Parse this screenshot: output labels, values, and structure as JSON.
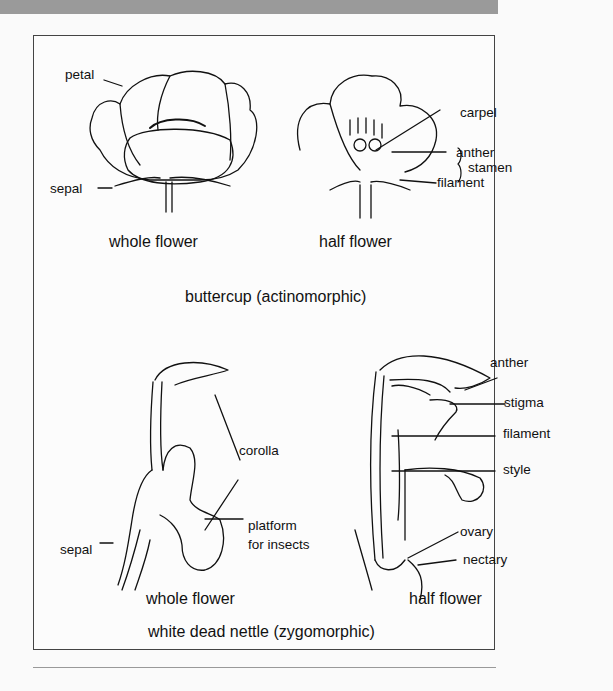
{
  "figure": {
    "buttercup": {
      "title": "buttercup (actinomorphic)",
      "whole_flower": {
        "caption": "whole flower",
        "labels": {
          "petal": "petal",
          "sepal": "sepal"
        }
      },
      "half_flower": {
        "caption": "half flower",
        "labels": {
          "carpel": "carpel",
          "anther": "anther",
          "filament": "filament",
          "stamen": "stamen"
        }
      }
    },
    "dead_nettle": {
      "title": "white dead nettle (zygomorphic)",
      "whole_flower": {
        "caption": "whole flower",
        "labels": {
          "corolla": "corolla",
          "platform": "platform",
          "platform_line2": "for insects",
          "sepal": "sepal"
        }
      },
      "half_flower": {
        "caption": "half flower",
        "labels": {
          "anther": "anther",
          "stigma": "stigma",
          "filament": "filament",
          "style": "style",
          "ovary": "ovary",
          "nectary": "nectary"
        }
      }
    }
  }
}
